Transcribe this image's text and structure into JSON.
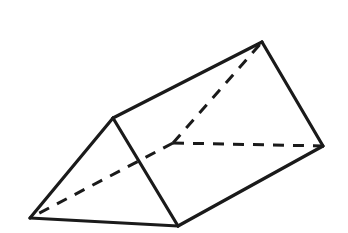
{
  "figure": {
    "shape_name": "triangular-prism",
    "canvas": {
      "width": 348,
      "height": 233
    },
    "colors": {
      "background": "#ffffff",
      "stroke": "#1a1a1a",
      "hidden_stroke": "#1a1a1a",
      "face": "#ffffff"
    },
    "stroke": {
      "solid_width": 3.2,
      "hidden_width": 3.0,
      "dash_pattern": "11 9"
    },
    "vertices": {
      "A": {
        "label": "bottom-left-apex",
        "x": 30,
        "y": 218,
        "hidden": false
      },
      "B": {
        "label": "left-top",
        "x": 113,
        "y": 118,
        "hidden": false
      },
      "C": {
        "label": "bottom-front",
        "x": 178,
        "y": 226,
        "hidden": false
      },
      "D": {
        "label": "top-apex",
        "x": 262,
        "y": 42,
        "hidden": false
      },
      "E": {
        "label": "right",
        "x": 323,
        "y": 146,
        "hidden": false
      },
      "F": {
        "label": "back-hidden",
        "x": 173,
        "y": 143,
        "hidden": true
      }
    },
    "faces": [
      {
        "name": "front-triangular-face",
        "points": "30,218 113,118 178,226",
        "visible": true
      },
      {
        "name": "top-rectangular-face",
        "points": "113,118 262,42 323,146 178,226",
        "visible": true
      }
    ],
    "edges_solid": [
      {
        "name": "edge-bottom-left-to-left-top",
        "from": "A",
        "to": "B",
        "points": "30,218 113,118"
      },
      {
        "name": "edge-bottom-left-to-bottom-front",
        "from": "A",
        "to": "C",
        "points": "30,218 178,226"
      },
      {
        "name": "edge-left-top-to-bottom-front",
        "from": "B",
        "to": "C",
        "points": "113,118 178,226"
      },
      {
        "name": "edge-left-top-to-top-apex",
        "from": "B",
        "to": "D",
        "points": "113,118 262,42"
      },
      {
        "name": "edge-top-apex-to-right",
        "from": "D",
        "to": "E",
        "points": "262,42 323,146"
      },
      {
        "name": "edge-bottom-front-to-right",
        "from": "C",
        "to": "E",
        "points": "178,226 323,146"
      }
    ],
    "edges_hidden": [
      {
        "name": "hidden-edge-back-to-bottom-left",
        "from": "F",
        "to": "A",
        "points": "173,143 30,218"
      },
      {
        "name": "hidden-edge-back-to-top-apex",
        "from": "F",
        "to": "D",
        "points": "173,143 262,42"
      },
      {
        "name": "hidden-edge-back-to-right",
        "from": "F",
        "to": "E",
        "points": "173,143 323,146"
      }
    ]
  }
}
